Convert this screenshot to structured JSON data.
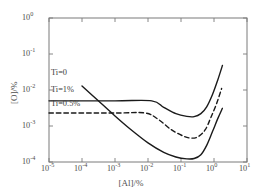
{
  "chart_data": {
    "type": "line",
    "title": "",
    "xlabel": "[Al]/%",
    "ylabel": "[O]/%",
    "xscale": "log",
    "yscale": "log",
    "xlim": [
      1e-05,
      10
    ],
    "ylim": [
      0.0001,
      1
    ],
    "grid": false,
    "legend_position": "inline-left",
    "xticks": [
      {
        "value": 1e-05,
        "label_mantissa": "10",
        "label_exponent": "-5"
      },
      {
        "value": 0.0001,
        "label_mantissa": "10",
        "label_exponent": "-4"
      },
      {
        "value": 0.001,
        "label_mantissa": "10",
        "label_exponent": "-3"
      },
      {
        "value": 0.01,
        "label_mantissa": "10",
        "label_exponent": "-2"
      },
      {
        "value": 0.1,
        "label_mantissa": "10",
        "label_exponent": "-1"
      },
      {
        "value": 1,
        "label_mantissa": "10",
        "label_exponent": "0"
      },
      {
        "value": 10,
        "label_mantissa": "10",
        "label_exponent": "1"
      }
    ],
    "yticks": [
      {
        "value": 1,
        "label_mantissa": "10",
        "label_exponent": "0"
      },
      {
        "value": 0.1,
        "label_mantissa": "10",
        "label_exponent": "-1"
      },
      {
        "value": 0.01,
        "label_mantissa": "10",
        "label_exponent": "-2"
      },
      {
        "value": 0.001,
        "label_mantissa": "10",
        "label_exponent": "-3"
      },
      {
        "value": 0.0001,
        "label_mantissa": "10",
        "label_exponent": "-4"
      }
    ],
    "series": [
      {
        "name": "Ti=0",
        "label": "Ti=0",
        "style": "solid",
        "color": "#1a1a1a",
        "points": [
          [
            0.0001,
            0.013
          ],
          [
            0.0003,
            0.0052
          ],
          [
            0.001,
            0.0019
          ],
          [
            0.003,
            0.0008
          ],
          [
            0.01,
            0.00034
          ],
          [
            0.03,
            0.000185
          ],
          [
            0.07,
            0.000138
          ],
          [
            0.15,
            0.000122
          ],
          [
            0.25,
            0.000125
          ],
          [
            0.4,
            0.00016
          ],
          [
            0.6,
            0.00029
          ],
          [
            0.9,
            0.0007
          ],
          [
            1.3,
            0.0016
          ],
          [
            1.8,
            0.0031
          ]
        ]
      },
      {
        "name": "Ti=1%",
        "label": "Ti=1%",
        "style": "solid",
        "color": "#1a1a1a",
        "points": [
          [
            1e-05,
            0.005
          ],
          [
            0.001,
            0.005
          ],
          [
            0.013,
            0.005
          ],
          [
            0.03,
            0.0033
          ],
          [
            0.07,
            0.0022
          ],
          [
            0.15,
            0.00185
          ],
          [
            0.25,
            0.00182
          ],
          [
            0.4,
            0.0022
          ],
          [
            0.6,
            0.0034
          ],
          [
            0.9,
            0.0075
          ],
          [
            1.3,
            0.019
          ],
          [
            1.8,
            0.048
          ]
        ]
      },
      {
        "name": "Ti=0.5%",
        "label": "Ti=0.5%",
        "style": "dashed",
        "color": "#1a1a1a",
        "points": [
          [
            1e-05,
            0.0023
          ],
          [
            0.001,
            0.0023
          ],
          [
            0.008,
            0.0023
          ],
          [
            0.02,
            0.00155
          ],
          [
            0.05,
            0.0008
          ],
          [
            0.12,
            0.00052
          ],
          [
            0.22,
            0.00046
          ],
          [
            0.35,
            0.00052
          ],
          [
            0.55,
            0.0008
          ],
          [
            0.8,
            0.0017
          ],
          [
            1.2,
            0.0042
          ],
          [
            1.7,
            0.011
          ]
        ]
      }
    ],
    "annotations": [
      {
        "text": "Ti=0",
        "x_px": 51,
        "y_px": 69
      },
      {
        "text": "Ti=1%",
        "x_px": 51,
        "y_px": 86
      },
      {
        "text": "Ti=0.5%",
        "x_px": 51,
        "y_px": 100
      }
    ]
  },
  "axes": {
    "frame_color": "#6b6b6b",
    "background": "#ffffff"
  }
}
